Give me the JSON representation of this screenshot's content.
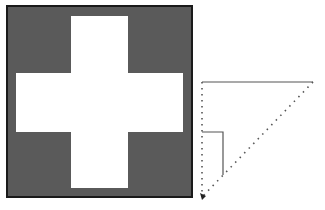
{
  "diagram": {
    "background": "#ffffff",
    "cross_figure": {
      "square": {
        "x": 7,
        "y": 6,
        "width": 185,
        "height": 191,
        "fill": "#5a5a5a",
        "stroke": "#1a1a1a"
      },
      "cross_color": "#ffffff",
      "vertical_bar": {
        "x": 71,
        "y": 16,
        "width": 57,
        "height": 172
      },
      "horizontal_bar": {
        "x": 16,
        "y": 73,
        "width": 167,
        "height": 59
      }
    },
    "triangle_figure": {
      "line_color": "#555555",
      "vertices": {
        "top_left": [
          202,
          82
        ],
        "top_right": [
          313,
          82
        ],
        "bottom_left": [
          202,
          197
        ]
      },
      "top_edge_style": "solid",
      "left_edge_style": "dotted",
      "hypotenuse_style": "dotted",
      "arrowhead_at": "bottom_left",
      "inner_marker": {
        "style": "solid",
        "points": [
          [
            202,
            132
          ],
          [
            223,
            132
          ],
          [
            223,
            175
          ]
        ]
      }
    }
  }
}
